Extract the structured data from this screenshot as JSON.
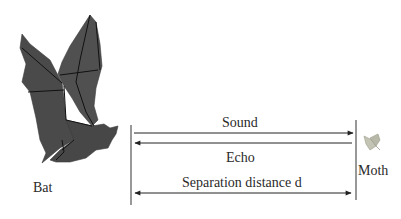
{
  "diagram": {
    "type": "echolocation-schematic",
    "labels": {
      "bat": "Bat",
      "moth": "Moth",
      "sound": "Sound",
      "echo": "Echo",
      "separation": "Separation distance d"
    },
    "icons": {
      "bat": "origami-bat-icon",
      "moth": "moth-icon"
    },
    "arrows": [
      {
        "name": "sound",
        "direction": "bat-to-moth"
      },
      {
        "name": "echo",
        "direction": "moth-to-bat"
      },
      {
        "name": "separation",
        "direction": "both"
      }
    ],
    "colors": {
      "bat_fill": "#4a4a4a",
      "bat_crease": "#111111",
      "line": "#333333",
      "moth": "#b8b8a8",
      "background": "#ffffff"
    }
  }
}
